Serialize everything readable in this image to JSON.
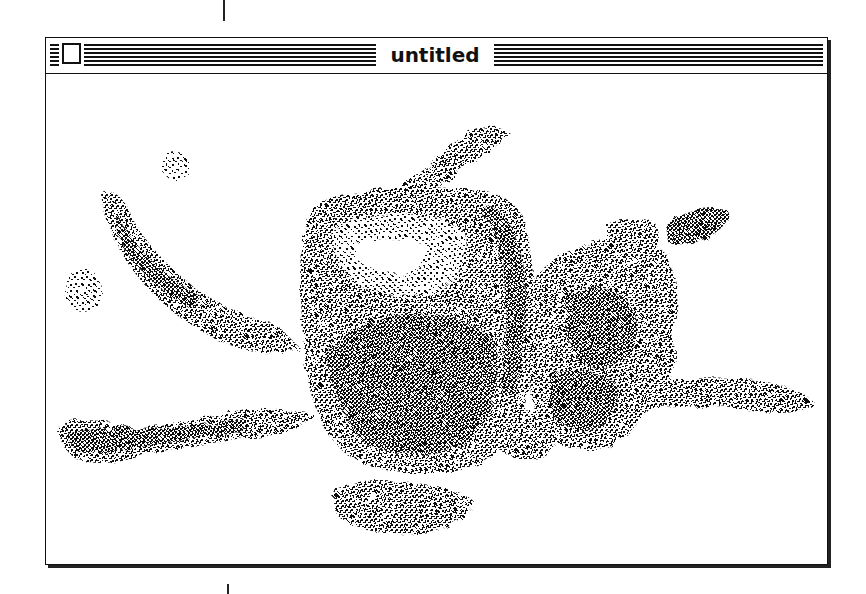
{
  "window": {
    "title": "untitled",
    "close_box": "close-box-icon"
  },
  "content": {
    "image": "dithered-photo-peppers",
    "colors": {
      "ink": "#111111",
      "paper": "#ffffff"
    }
  }
}
